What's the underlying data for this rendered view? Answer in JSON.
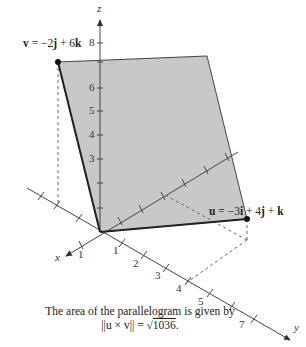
{
  "diagram": {
    "type": "3d-vector-parallelogram",
    "axes": {
      "z_label": "z",
      "x_label": "x",
      "y_label": "y",
      "z_ticks": [
        "3",
        "4",
        "5",
        "6",
        "8"
      ],
      "x_ticks": [
        "1"
      ],
      "y_ticks": [
        "1",
        "2",
        "3",
        "4",
        "5",
        "7"
      ]
    },
    "vectors": {
      "v_label": "v = −2j + 6k",
      "v_parts": {
        "name": "v",
        "eq": " = −2",
        "j": "j",
        "mid": " + 6",
        "k": "k"
      },
      "u_label": "u = −3i + 4j + k",
      "u_parts": {
        "name": "u",
        "eq": " = −3",
        "i": "i",
        "mid1": " + 4",
        "j": "j",
        "mid2": " + ",
        "k": "k"
      }
    },
    "caption": {
      "line1": "The area of the parallelogram is given by",
      "line2_prefix": "||u × v|| = ",
      "line2_value": "1036",
      "line2_suffix": "."
    },
    "colors": {
      "fill": "#c8c8c8",
      "edge": "#222222",
      "axis": "#444444",
      "dashed": "#666666"
    }
  }
}
